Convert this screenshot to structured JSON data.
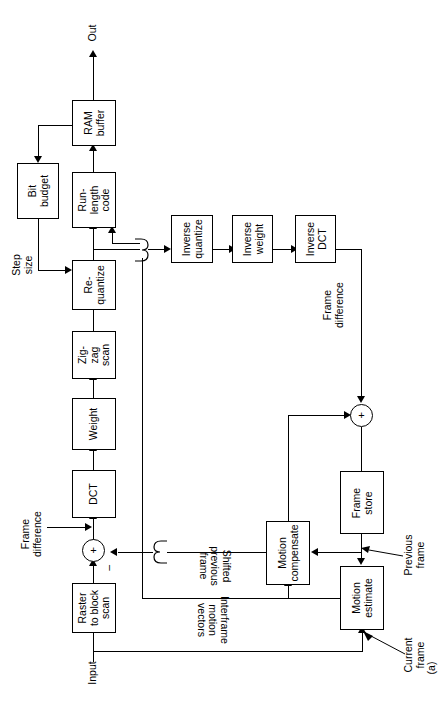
{
  "figure": {
    "caption": "(a)",
    "orientation": "rotated-90-ccw",
    "line_color": "#000000",
    "background_color": "#ffffff"
  },
  "blocks": [
    {
      "id": "ram-buffer",
      "label": "RAM\nbuffer"
    },
    {
      "id": "bit-budget",
      "label": "Bit\nbudget"
    },
    {
      "id": "run-length-code",
      "label": "Run-\nlength\ncode"
    },
    {
      "id": "re-quantize",
      "label": "Re-\nquantize"
    },
    {
      "id": "zig-zag-scan",
      "label": "Zig-\nzag\nscan"
    },
    {
      "id": "weight",
      "label": "Weight"
    },
    {
      "id": "dct",
      "label": "DCT"
    },
    {
      "id": "raster-to-block-scan",
      "label": "Raster\nto block\nscan"
    },
    {
      "id": "inverse-quantize",
      "label": "Inverse\nquantize"
    },
    {
      "id": "inverse-weight",
      "label": "Inverse\nweight"
    },
    {
      "id": "inverse-dct",
      "label": "Inverse\nDCT"
    },
    {
      "id": "frame-store",
      "label": "Frame\nstore"
    },
    {
      "id": "motion-compensate",
      "label": "Motion\ncompensate"
    },
    {
      "id": "motion-estimate",
      "label": "Motion\nestimate"
    }
  ],
  "labels": {
    "out": "Out",
    "input": "Input",
    "step_size": "Step\nsize",
    "frame_difference_left": "Frame\ndifference",
    "frame_difference_right": "Frame\ndifference",
    "shifted_previous_frame": "Shifted\nprevious\nframe",
    "interframe_motion_vectors": "Interframe\nmotion\nvectors",
    "previous_frame": "Previous\nframe",
    "current_frame": "Current\nframe",
    "caption": "(a)",
    "adder_plus": "+",
    "adder_minus": "–"
  }
}
